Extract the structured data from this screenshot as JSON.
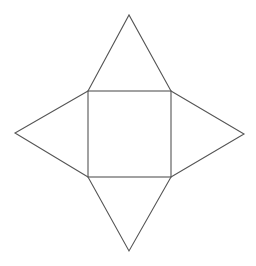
{
  "diagram": {
    "title": "",
    "stroke_color": "#555555",
    "background_color": "#ffffff",
    "shapes": [
      {
        "name": "base-square",
        "type": "square"
      },
      {
        "name": "face-top",
        "type": "triangle",
        "attached_to": "top"
      },
      {
        "name": "face-right",
        "type": "triangle",
        "attached_to": "right"
      },
      {
        "name": "face-bottom",
        "type": "triangle",
        "attached_to": "bottom"
      },
      {
        "name": "face-left",
        "type": "triangle",
        "attached_to": "left"
      }
    ]
  }
}
